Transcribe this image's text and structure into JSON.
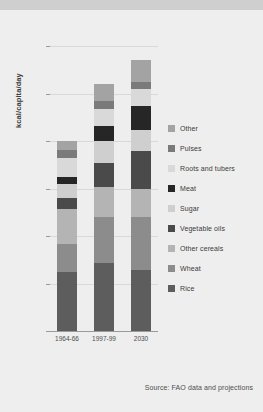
{
  "chart_data": {
    "type": "bar",
    "title": "",
    "subtitle": "",
    "xlabel": "",
    "ylabel": "kcal/capita/day",
    "categories": [
      "1964-66",
      "1997-99",
      "2030"
    ],
    "ylim": [
      0,
      3000
    ],
    "yticks": [
      0,
      500,
      1000,
      1500,
      2000,
      2500,
      3000
    ],
    "ytick_labels": [
      "0",
      "500",
      "1 000",
      "1 500",
      "2 000",
      "2 500",
      "3 000"
    ],
    "grid": true,
    "stacked": true,
    "legend_position": "right",
    "stack_order_bottom_to_top": [
      "Rice",
      "Wheat",
      "Other cereals",
      "Vegetable oils",
      "Sugar",
      "Meat",
      "Roots and tubers",
      "Pulses",
      "Other"
    ],
    "series": [
      {
        "name": "Rice",
        "color": "#5d5d5d",
        "values": [
          620,
          720,
          640
        ]
      },
      {
        "name": "Wheat",
        "color": "#8c8c8c",
        "values": [
          300,
          480,
          560
        ]
      },
      {
        "name": "Other cereals",
        "color": "#b4b4b4",
        "values": [
          360,
          320,
          290
        ]
      },
      {
        "name": "Vegetable oils",
        "color": "#4a4a4a",
        "values": [
          120,
          250,
          400
        ]
      },
      {
        "name": "Sugar",
        "color": "#cfcfcf",
        "values": [
          150,
          230,
          230
        ]
      },
      {
        "name": "Meat",
        "color": "#262626",
        "values": [
          70,
          160,
          250
        ]
      },
      {
        "name": "Roots and tubers",
        "color": "#d9d9d9",
        "values": [
          200,
          180,
          180
        ]
      },
      {
        "name": "Pulses",
        "color": "#7a7a7a",
        "values": [
          90,
          80,
          70
        ]
      },
      {
        "name": "Other",
        "color": "#a3a3a3",
        "values": [
          90,
          180,
          230
        ]
      }
    ],
    "totals": [
      2000,
      2600,
      2850
    ],
    "legend_entries": [
      {
        "label": "Other",
        "color": "#a3a3a3"
      },
      {
        "label": "Pulses",
        "color": "#7a7a7a"
      },
      {
        "label": "Roots and tubers",
        "color": "#d9d9d9"
      },
      {
        "label": "Meat",
        "color": "#262626"
      },
      {
        "label": "Sugar",
        "color": "#cfcfcf"
      },
      {
        "label": "Vegetable oils",
        "color": "#4a4a4a"
      },
      {
        "label": "Other cereals",
        "color": "#b4b4b4"
      },
      {
        "label": "Wheat",
        "color": "#8c8c8c"
      },
      {
        "label": "Rice",
        "color": "#5d5d5d"
      }
    ],
    "source_note": "Source: FAO data and projections"
  },
  "colors": {
    "page_background": "#eeeeee",
    "top_band": "#cfcfcf",
    "gridline": "#d8d8d8",
    "axis": "#9a9a9a",
    "text": "#3b3b3b",
    "tick_text": "#4d4d4d"
  }
}
